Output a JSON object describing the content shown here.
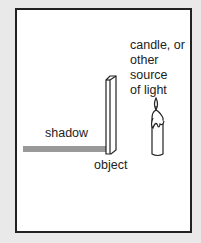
{
  "labels": {
    "light_source": [
      "candle, or",
      "other",
      "source",
      "of light"
    ],
    "shadow": "shadow",
    "object": "object"
  },
  "colors": {
    "shadow": "#999999",
    "border": "#222222",
    "background": "#e9e9e9"
  }
}
